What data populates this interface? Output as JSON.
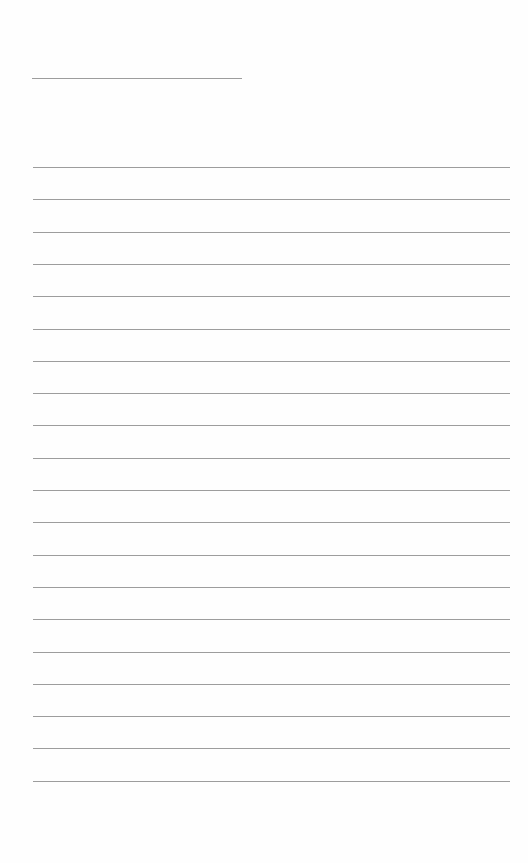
{
  "document": {
    "type": "lined-writing-sheet",
    "background_color": "#fefefe",
    "rule_color": "#8c8c8c",
    "title_line": {
      "text": "",
      "x": 32,
      "y": 78,
      "width": 210
    },
    "writing_lines": {
      "count": 20,
      "x": 33,
      "width": 477,
      "first_y": 167,
      "spacing": 32.3,
      "lines": [
        "",
        "",
        "",
        "",
        "",
        "",
        "",
        "",
        "",
        "",
        "",
        "",
        "",
        "",
        "",
        "",
        "",
        "",
        "",
        ""
      ]
    }
  }
}
